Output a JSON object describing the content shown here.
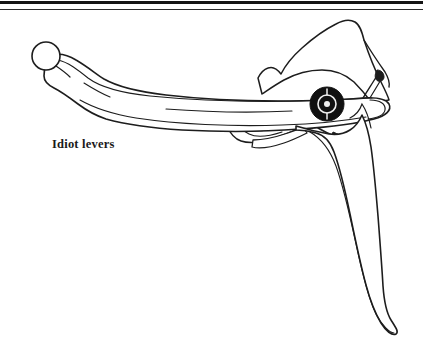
{
  "page": {
    "width": 423,
    "height": 339,
    "background_color": "#ffffff"
  },
  "rules": {
    "thick_rule_color": "#151515",
    "thin_rule_color": "#2b2b2b"
  },
  "caption": {
    "text": "Idiot levers"
  },
  "illustration": {
    "title": "bicycle-brake-lever-line-drawing",
    "subject": "Drop-bar bicycle brake lever with hood, body, clamp and curved lever blade",
    "line_color": "#1d1d1d",
    "fill_color": "#ffffff",
    "barrel_adjuster_color": "#111111",
    "barrel_adjuster_detail_color": "#efefef",
    "parts": [
      {
        "name": "ball-end-knob",
        "label": "ball end"
      },
      {
        "name": "lever-body",
        "label": "lever body"
      },
      {
        "name": "hood-mount",
        "label": "hood / mount"
      },
      {
        "name": "handlebar-clamp",
        "label": "clamp"
      },
      {
        "name": "barrel-adjuster",
        "label": "barrel adjuster"
      },
      {
        "name": "lever-blade",
        "label": "lever blade"
      }
    ]
  }
}
